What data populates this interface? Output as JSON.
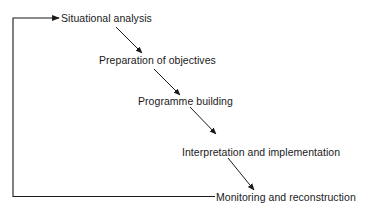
{
  "diagram": {
    "type": "process-flow",
    "steps": [
      {
        "id": "step-1",
        "label": "Situational analysis"
      },
      {
        "id": "step-2",
        "label": "Preparation of objectives"
      },
      {
        "id": "step-3",
        "label": "Programme building"
      },
      {
        "id": "step-4",
        "label": "Interpretation and implementation"
      },
      {
        "id": "step-5",
        "label": "Monitoring and reconstruction"
      }
    ],
    "edges": [
      {
        "from": "step-1",
        "to": "step-2"
      },
      {
        "from": "step-2",
        "to": "step-3"
      },
      {
        "from": "step-3",
        "to": "step-4"
      },
      {
        "from": "step-4",
        "to": "step-5"
      },
      {
        "from": "step-5",
        "to": "step-1",
        "kind": "feedback-loop"
      }
    ],
    "colors": {
      "line": "#1a1a1a",
      "background": "#ffffff"
    }
  }
}
